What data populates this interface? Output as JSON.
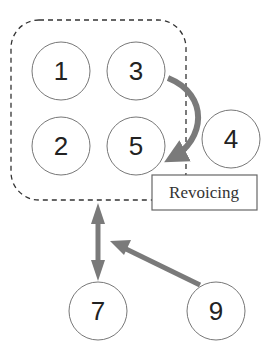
{
  "diagram": {
    "nodes": [
      {
        "id": "1",
        "label": "1",
        "cx": 61,
        "cy": 71
      },
      {
        "id": "3",
        "label": "3",
        "cx": 136,
        "cy": 71
      },
      {
        "id": "2",
        "label": "2",
        "cx": 61,
        "cy": 146
      },
      {
        "id": "5",
        "label": "5",
        "cx": 136,
        "cy": 146
      },
      {
        "id": "4",
        "label": "4",
        "cx": 231,
        "cy": 139
      },
      {
        "id": "7",
        "label": "7",
        "cx": 98,
        "cy": 311
      },
      {
        "id": "9",
        "label": "9",
        "cx": 216,
        "cy": 311
      }
    ],
    "group": {
      "style": "dashed",
      "members": [
        "1",
        "3",
        "2",
        "5"
      ]
    },
    "annotation_label": "Revoicing",
    "edges": [
      {
        "from": "3",
        "to": "5",
        "style": "curved-arrow",
        "label": "Revoicing"
      },
      {
        "from": "7",
        "to": "group",
        "style": "double-arrow"
      },
      {
        "from": "9",
        "to": "group-link",
        "style": "arrow"
      }
    ],
    "colors": {
      "arrow": "#7a7a7a",
      "stroke": "#555555"
    }
  }
}
